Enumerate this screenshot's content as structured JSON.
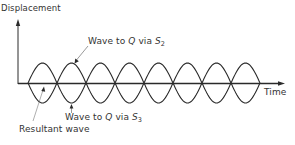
{
  "diagram": {
    "y_axis_label": "Displacement",
    "x_axis_label": "Time",
    "labels": {
      "wave_s2": {
        "prefix": "Wave to ",
        "target": "Q",
        "via": " via ",
        "source": "S",
        "source_sub": "2"
      },
      "wave_s3": {
        "prefix": "Wave to ",
        "target": "Q",
        "via": " via ",
        "source": "S",
        "source_sub": "3"
      },
      "resultant": "Resultant wave"
    },
    "waves": {
      "lobes": 8,
      "start_x": 28,
      "end_x": 260,
      "baseline_y": 83,
      "amplitude": 20,
      "phase_relation": "antiphase (180°)",
      "resultant": "zero (destructive interference)"
    },
    "colors": {
      "line": "#2a2a2a",
      "pointer": "#555555",
      "background": "#ffffff"
    }
  }
}
